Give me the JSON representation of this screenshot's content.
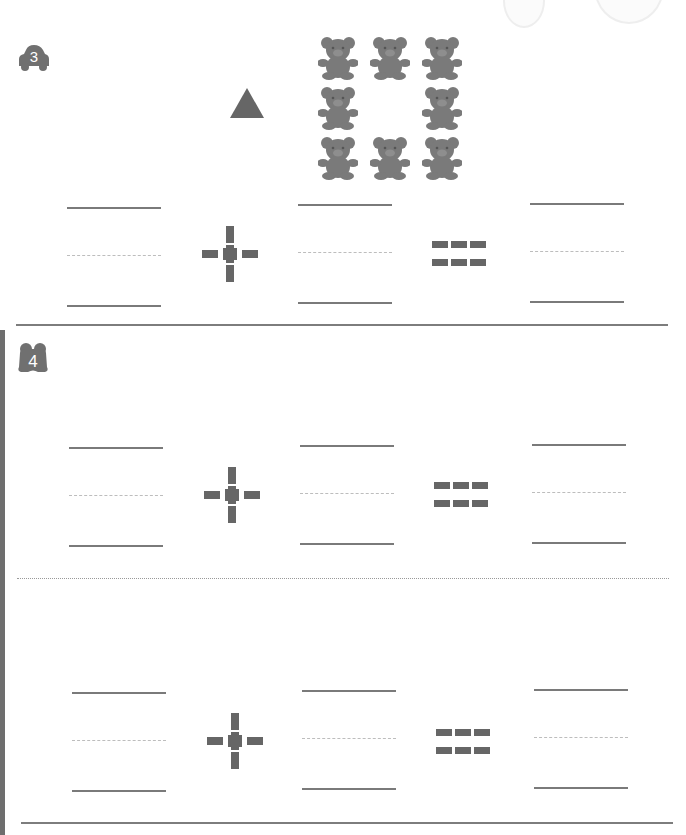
{
  "worksheet": {
    "type": "addition practice",
    "colors": {
      "ink": "#666666",
      "line": "#7a7a7a",
      "guide_line": "#bdbdbd"
    },
    "sections": [
      {
        "number": "3",
        "badge_icon": "car-icon",
        "prompt_images": {
          "shape": "triangle",
          "shape_count": 1,
          "bear_grid": {
            "rows": 3,
            "cols": 3,
            "count": 8,
            "missing": "center"
          }
        },
        "equations": [
          {
            "operand1": "",
            "operator": "+",
            "operand2": "",
            "equals": "=",
            "result": ""
          }
        ]
      },
      {
        "number": "4",
        "badge_icon": "frog-icon",
        "equations": [
          {
            "operand1": "",
            "operator": "+",
            "operand2": "",
            "equals": "=",
            "result": ""
          },
          {
            "operand1": "",
            "operator": "+",
            "operand2": "",
            "equals": "=",
            "result": ""
          }
        ]
      }
    ]
  }
}
